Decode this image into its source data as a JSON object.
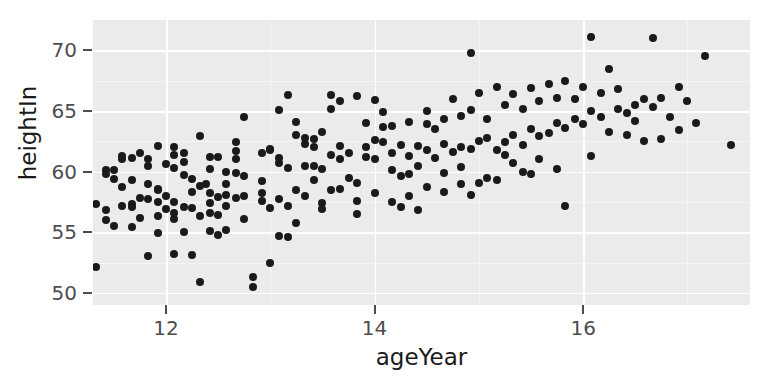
{
  "chart_data": {
    "type": "scatter",
    "title": "",
    "xlabel": "ageYear",
    "ylabel": "heightIn",
    "xlim": [
      11.3,
      17.6
    ],
    "ylim": [
      49.0,
      72.5
    ],
    "xticks": [
      12,
      14,
      16
    ],
    "yticks": [
      50,
      55,
      60,
      65,
      70
    ],
    "xtick_labels": [
      "12",
      "14",
      "16"
    ],
    "ytick_labels": [
      "50",
      "55",
      "60",
      "65",
      "70"
    ],
    "grid": true,
    "legend": "none",
    "panel_background": "#ebebeb",
    "grid_color": "#ffffff",
    "point_color": "#1a1a1a",
    "point_count": 236,
    "points": [
      [
        11.92,
        56.3
      ],
      [
        12.38,
        59.0
      ],
      [
        11.33,
        52.1
      ],
      [
        11.42,
        60.1
      ],
      [
        12.67,
        59.9
      ],
      [
        11.92,
        57.5
      ],
      [
        11.58,
        61.3
      ],
      [
        12.17,
        61.5
      ],
      [
        11.33,
        57.3
      ],
      [
        11.58,
        61.0
      ],
      [
        11.5,
        59.4
      ],
      [
        11.42,
        59.8
      ],
      [
        12.75,
        56.1
      ],
      [
        11.67,
        57.3
      ],
      [
        11.83,
        59.0
      ],
      [
        12.42,
        58.2
      ],
      [
        11.42,
        56.0
      ],
      [
        11.5,
        55.5
      ],
      [
        12.08,
        57.5
      ],
      [
        11.75,
        61.5
      ],
      [
        11.5,
        60.1
      ],
      [
        11.67,
        59.3
      ],
      [
        12.0,
        58.0
      ],
      [
        11.92,
        58.5
      ],
      [
        11.83,
        61.0
      ],
      [
        11.42,
        56.8
      ],
      [
        12.17,
        59.7
      ],
      [
        11.58,
        57.2
      ],
      [
        11.83,
        53.0
      ],
      [
        12.08,
        53.2
      ],
      [
        12.25,
        53.1
      ],
      [
        11.83,
        57.7
      ],
      [
        11.67,
        61.1
      ],
      [
        12.42,
        61.2
      ],
      [
        11.92,
        54.9
      ],
      [
        12.08,
        60.3
      ],
      [
        11.75,
        57.8
      ],
      [
        12.33,
        50.9
      ],
      [
        12.25,
        59.4
      ],
      [
        12.25,
        58.3
      ],
      [
        12.08,
        56.1
      ],
      [
        11.67,
        57.1
      ],
      [
        11.92,
        58.6
      ],
      [
        12.33,
        62.9
      ],
      [
        12.17,
        60.8
      ],
      [
        12.42,
        57.4
      ],
      [
        12.5,
        56.4
      ],
      [
        12.08,
        56.6
      ],
      [
        12.42,
        60.2
      ],
      [
        12.58,
        60.0
      ],
      [
        12.5,
        61.2
      ],
      [
        12.83,
        50.5
      ],
      [
        12.83,
        51.3
      ],
      [
        12.5,
        54.8
      ],
      [
        12.67,
        61.7
      ],
      [
        12.58,
        58.1
      ],
      [
        12.42,
        55.1
      ],
      [
        12.75,
        58.0
      ],
      [
        12.92,
        61.5
      ],
      [
        12.92,
        59.2
      ],
      [
        12.67,
        57.8
      ],
      [
        13.0,
        52.5
      ],
      [
        12.58,
        57.2
      ],
      [
        12.67,
        61.0
      ],
      [
        12.75,
        64.5
      ],
      [
        13.08,
        60.7
      ],
      [
        13.0,
        61.8
      ],
      [
        12.92,
        58.2
      ],
      [
        13.17,
        54.6
      ],
      [
        13.17,
        60.3
      ],
      [
        13.08,
        57.7
      ],
      [
        13.25,
        63.0
      ],
      [
        13.0,
        61.9
      ],
      [
        13.25,
        58.5
      ],
      [
        13.08,
        61.1
      ],
      [
        13.33,
        62.3
      ],
      [
        13.17,
        66.3
      ],
      [
        13.42,
        59.3
      ],
      [
        13.33,
        60.5
      ],
      [
        13.25,
        64.1
      ],
      [
        13.42,
        60.5
      ],
      [
        13.08,
        65.1
      ],
      [
        13.5,
        60.2
      ],
      [
        13.58,
        58.5
      ],
      [
        13.42,
        62.0
      ],
      [
        13.5,
        63.3
      ],
      [
        13.33,
        62.8
      ],
      [
        13.58,
        61.4
      ],
      [
        13.5,
        56.9
      ],
      [
        13.67,
        61.0
      ],
      [
        13.58,
        65.2
      ],
      [
        13.42,
        62.7
      ],
      [
        13.75,
        59.5
      ],
      [
        13.67,
        62.1
      ],
      [
        13.83,
        57.6
      ],
      [
        13.75,
        61.5
      ],
      [
        13.58,
        66.3
      ],
      [
        13.92,
        62.0
      ],
      [
        13.83,
        56.5
      ],
      [
        14.0,
        61.0
      ],
      [
        13.92,
        64.0
      ],
      [
        13.67,
        65.8
      ],
      [
        14.08,
        62.4
      ],
      [
        14.0,
        65.9
      ],
      [
        14.17,
        60.1
      ],
      [
        13.83,
        66.2
      ],
      [
        14.08,
        63.7
      ],
      [
        14.17,
        61.5
      ],
      [
        14.0,
        62.6
      ],
      [
        14.25,
        59.6
      ],
      [
        14.17,
        63.8
      ],
      [
        14.33,
        61.3
      ],
      [
        14.25,
        62.2
      ],
      [
        14.08,
        64.9
      ],
      [
        14.42,
        60.5
      ],
      [
        14.33,
        64.1
      ],
      [
        14.5,
        61.8
      ],
      [
        14.33,
        58.0
      ],
      [
        14.5,
        63.9
      ],
      [
        14.42,
        62.1
      ],
      [
        14.58,
        61.1
      ],
      [
        14.5,
        65.0
      ],
      [
        14.67,
        62.3
      ],
      [
        14.58,
        63.5
      ],
      [
        14.42,
        56.8
      ],
      [
        14.75,
        61.6
      ],
      [
        14.67,
        64.3
      ],
      [
        14.83,
        62.0
      ],
      [
        14.67,
        58.3
      ],
      [
        14.83,
        64.6
      ],
      [
        14.75,
        66.0
      ],
      [
        14.92,
        61.9
      ],
      [
        14.83,
        59.0
      ],
      [
        15.0,
        62.5
      ],
      [
        14.92,
        65.1
      ],
      [
        15.08,
        62.8
      ],
      [
        15.0,
        66.5
      ],
      [
        15.17,
        61.8
      ],
      [
        15.08,
        64.3
      ],
      [
        14.92,
        69.8
      ],
      [
        15.25,
        62.4
      ],
      [
        15.17,
        67.0
      ],
      [
        15.33,
        63.0
      ],
      [
        15.25,
        65.5
      ],
      [
        15.08,
        59.5
      ],
      [
        15.42,
        62.2
      ],
      [
        15.33,
        66.4
      ],
      [
        15.5,
        63.5
      ],
      [
        15.42,
        65.2
      ],
      [
        15.25,
        61.4
      ],
      [
        15.58,
        62.9
      ],
      [
        15.5,
        66.9
      ],
      [
        15.67,
        63.2
      ],
      [
        15.58,
        65.8
      ],
      [
        15.42,
        60.0
      ],
      [
        15.75,
        64.0
      ],
      [
        15.67,
        67.2
      ],
      [
        15.83,
        63.6
      ],
      [
        15.75,
        66.1
      ],
      [
        15.58,
        61.0
      ],
      [
        15.92,
        64.3
      ],
      [
        15.83,
        67.5
      ],
      [
        16.0,
        63.9
      ],
      [
        15.92,
        66.0
      ],
      [
        15.75,
        60.2
      ],
      [
        16.08,
        65.0
      ],
      [
        16.0,
        67.0
      ],
      [
        16.17,
        64.5
      ],
      [
        16.08,
        71.1
      ],
      [
        16.25,
        63.3
      ],
      [
        16.17,
        66.5
      ],
      [
        16.33,
        65.2
      ],
      [
        16.25,
        68.5
      ],
      [
        16.08,
        61.3
      ],
      [
        16.42,
        64.8
      ],
      [
        16.33,
        66.8
      ],
      [
        16.5,
        65.5
      ],
      [
        16.42,
        63.0
      ],
      [
        16.58,
        66.0
      ],
      [
        16.5,
        64.2
      ],
      [
        16.67,
        65.3
      ],
      [
        16.58,
        62.5
      ],
      [
        16.75,
        66.1
      ],
      [
        16.67,
        71.0
      ],
      [
        16.83,
        64.5
      ],
      [
        17.0,
        65.8
      ],
      [
        17.17,
        69.5
      ],
      [
        17.42,
        62.2
      ],
      [
        17.08,
        64.0
      ],
      [
        16.92,
        63.4
      ],
      [
        12.08,
        61.4
      ],
      [
        12.25,
        57.0
      ],
      [
        11.58,
        58.7
      ],
      [
        11.75,
        56.2
      ],
      [
        12.0,
        56.9
      ],
      [
        12.33,
        56.3
      ],
      [
        11.67,
        55.4
      ],
      [
        12.17,
        55.0
      ],
      [
        12.5,
        57.9
      ],
      [
        12.33,
        58.8
      ],
      [
        11.83,
        60.5
      ],
      [
        12.0,
        60.6
      ],
      [
        12.58,
        59.0
      ],
      [
        12.75,
        59.6
      ],
      [
        12.17,
        57.1
      ],
      [
        12.92,
        57.6
      ],
      [
        13.0,
        57.0
      ],
      [
        13.17,
        57.2
      ],
      [
        13.33,
        58.0
      ],
      [
        12.58,
        55.2
      ],
      [
        13.5,
        57.4
      ],
      [
        13.67,
        58.6
      ],
      [
        13.83,
        59.1
      ],
      [
        14.0,
        58.2
      ],
      [
        14.17,
        57.5
      ],
      [
        14.33,
        59.8
      ],
      [
        14.5,
        58.7
      ],
      [
        14.67,
        59.9
      ],
      [
        14.83,
        60.4
      ],
      [
        15.0,
        59.1
      ],
      [
        15.17,
        59.3
      ],
      [
        15.33,
        60.7
      ],
      [
        15.5,
        59.8
      ],
      [
        13.25,
        55.8
      ],
      [
        13.08,
        54.7
      ],
      [
        12.42,
        56.6
      ],
      [
        12.08,
        62.0
      ],
      [
        11.92,
        62.1
      ],
      [
        12.67,
        62.4
      ],
      [
        13.92,
        61.2
      ],
      [
        14.92,
        58.1
      ],
      [
        14.25,
        57.1
      ],
      [
        15.83,
        57.2
      ],
      [
        16.75,
        62.7
      ],
      [
        16.92,
        67.0
      ]
    ]
  },
  "axes": {
    "y_title": "heightIn",
    "x_title": "ageYear"
  }
}
